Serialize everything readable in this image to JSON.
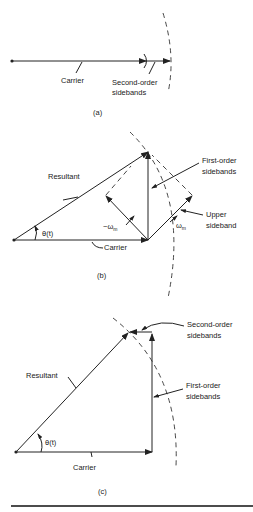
{
  "diagram": {
    "panel_a": {
      "caption": "(a)",
      "labels": {
        "carrier": "Carrier",
        "second_order_line1": "Second-order",
        "second_order_line2": "sidebands"
      }
    },
    "panel_b": {
      "caption": "(b)",
      "labels": {
        "resultant": "Resultant",
        "theta": "θ(t)",
        "carrier": "Carrier",
        "minus_omega": "−ω",
        "omega": "ω",
        "subscript_m": "m",
        "first_order_line1": "First-order",
        "first_order_line2": "sidebands",
        "upper_line1": "Upper",
        "upper_line2": "sideband"
      }
    },
    "panel_c": {
      "caption": "(c)",
      "labels": {
        "resultant": "Resultant",
        "theta": "θ(t)",
        "carrier": "Carrier",
        "second_order_line1": "Second-order",
        "second_order_line2": "sidebands",
        "first_order_line1": "First-order",
        "first_order_line2": "sidebands"
      }
    }
  }
}
